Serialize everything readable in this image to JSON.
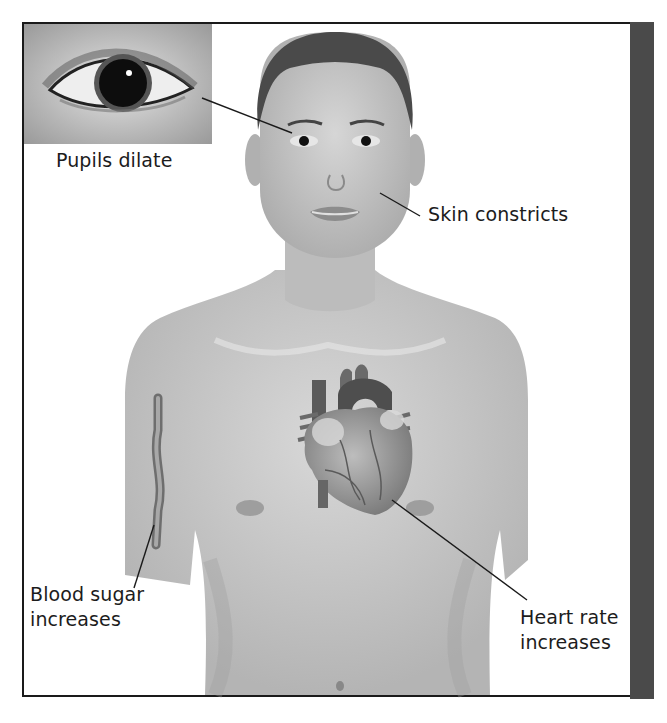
{
  "figure": {
    "inset": {
      "name": "eye-closeup",
      "description": "Close-up of eye with dilated pupil"
    },
    "labels": [
      {
        "id": "pupils",
        "lines": [
          "Pupils dilate"
        ]
      },
      {
        "id": "skin",
        "lines": [
          "Skin constricts"
        ]
      },
      {
        "id": "blood",
        "lines": [
          "Blood sugar",
          "increases"
        ]
      },
      {
        "id": "heart",
        "lines": [
          "Heart rate",
          "increases"
        ]
      }
    ]
  },
  "colors": {
    "border": "#1a1a1a",
    "side_bar": "#4a4a4a",
    "skin": "#c9c9c9",
    "text": "#1c1c1c"
  }
}
